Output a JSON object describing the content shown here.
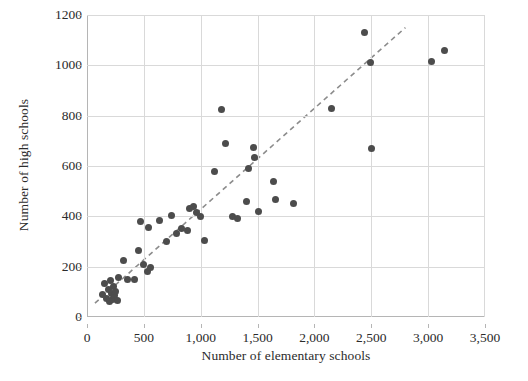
{
  "chart_data": {
    "type": "scatter",
    "title": "",
    "xlabel": "Number of elementary schools",
    "ylabel": "Number of high schools",
    "xlim": [
      0,
      3500
    ],
    "ylim": [
      0,
      1200
    ],
    "xticks": [
      0,
      500,
      1000,
      1500,
      2000,
      2500,
      3000,
      3500
    ],
    "xtick_labels": [
      "0",
      "500",
      "1,000",
      "1,500",
      "2,000",
      "2,500",
      "3,000",
      "3,500"
    ],
    "yticks": [
      0,
      200,
      400,
      600,
      800,
      1000,
      1200
    ],
    "ytick_labels": [
      "0",
      "200",
      "400",
      "600",
      "800",
      "1000",
      "1200"
    ],
    "grid": true,
    "legend": "none",
    "point_color": "#4c4c4c",
    "gridline_color": "#d9d9d9",
    "trendline": {
      "style": "dashed",
      "color": "#8c8c8c",
      "x_start": 70,
      "y_start": 55,
      "x_end": 2800,
      "y_end": 1150
    },
    "points": [
      {
        "x": 140,
        "y": 90
      },
      {
        "x": 155,
        "y": 135
      },
      {
        "x": 170,
        "y": 75
      },
      {
        "x": 185,
        "y": 110
      },
      {
        "x": 195,
        "y": 60
      },
      {
        "x": 205,
        "y": 145
      },
      {
        "x": 215,
        "y": 95
      },
      {
        "x": 225,
        "y": 70
      },
      {
        "x": 235,
        "y": 120
      },
      {
        "x": 245,
        "y": 85
      },
      {
        "x": 255,
        "y": 100
      },
      {
        "x": 265,
        "y": 65
      },
      {
        "x": 280,
        "y": 155
      },
      {
        "x": 320,
        "y": 225
      },
      {
        "x": 355,
        "y": 150
      },
      {
        "x": 420,
        "y": 150
      },
      {
        "x": 450,
        "y": 265
      },
      {
        "x": 470,
        "y": 380
      },
      {
        "x": 500,
        "y": 210
      },
      {
        "x": 530,
        "y": 180
      },
      {
        "x": 545,
        "y": 355
      },
      {
        "x": 560,
        "y": 195
      },
      {
        "x": 640,
        "y": 385
      },
      {
        "x": 700,
        "y": 300
      },
      {
        "x": 745,
        "y": 405
      },
      {
        "x": 790,
        "y": 330
      },
      {
        "x": 830,
        "y": 350
      },
      {
        "x": 880,
        "y": 345
      },
      {
        "x": 905,
        "y": 430
      },
      {
        "x": 935,
        "y": 440
      },
      {
        "x": 960,
        "y": 415
      },
      {
        "x": 1000,
        "y": 400
      },
      {
        "x": 1030,
        "y": 305
      },
      {
        "x": 1120,
        "y": 580
      },
      {
        "x": 1180,
        "y": 825
      },
      {
        "x": 1220,
        "y": 690
      },
      {
        "x": 1280,
        "y": 400
      },
      {
        "x": 1320,
        "y": 390
      },
      {
        "x": 1400,
        "y": 460
      },
      {
        "x": 1420,
        "y": 590
      },
      {
        "x": 1460,
        "y": 675
      },
      {
        "x": 1470,
        "y": 635
      },
      {
        "x": 1510,
        "y": 420
      },
      {
        "x": 1640,
        "y": 540
      },
      {
        "x": 1660,
        "y": 465
      },
      {
        "x": 1820,
        "y": 450
      },
      {
        "x": 2150,
        "y": 830
      },
      {
        "x": 2440,
        "y": 1130
      },
      {
        "x": 2490,
        "y": 1010
      },
      {
        "x": 2500,
        "y": 670
      },
      {
        "x": 3030,
        "y": 1015
      },
      {
        "x": 3140,
        "y": 1060
      }
    ]
  }
}
